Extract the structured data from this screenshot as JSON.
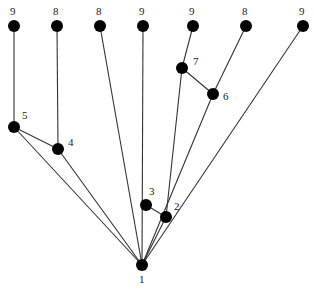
{
  "diagram": {
    "type": "tree",
    "colors": {
      "node": "#000000",
      "edge": "#333333",
      "label": "#222222",
      "background": "#ffffff"
    },
    "nodes": [
      {
        "id": "t1",
        "label": "9",
        "x": 14,
        "y": 26,
        "lx": 10,
        "ly": 15
      },
      {
        "id": "t2",
        "label": "8",
        "x": 57,
        "y": 26,
        "lx": 53,
        "ly": 15
      },
      {
        "id": "t3",
        "label": "8",
        "x": 100,
        "y": 26,
        "lx": 96,
        "ly": 15
      },
      {
        "id": "t4",
        "label": "9",
        "x": 143,
        "y": 26,
        "lx": 139,
        "ly": 15
      },
      {
        "id": "t5",
        "label": "9",
        "x": 193,
        "y": 26,
        "lx": 189,
        "ly": 15
      },
      {
        "id": "t6",
        "label": "8",
        "x": 246,
        "y": 26,
        "lx": 242,
        "ly": 15
      },
      {
        "id": "t7",
        "label": "9",
        "x": 303,
        "y": 26,
        "lx": 299,
        "ly": 15
      },
      {
        "id": "n5",
        "label": "5",
        "x": 14,
        "y": 127,
        "lx": 22,
        "ly": 119
      },
      {
        "id": "n4",
        "label": "4",
        "x": 58,
        "y": 149,
        "lx": 68,
        "ly": 146
      },
      {
        "id": "n7",
        "label": "7",
        "x": 182,
        "y": 68,
        "lx": 193,
        "ly": 65
      },
      {
        "id": "n6",
        "label": "6",
        "x": 213,
        "y": 94,
        "lx": 223,
        "ly": 100
      },
      {
        "id": "n3",
        "label": "3",
        "x": 146,
        "y": 205,
        "lx": 149,
        "ly": 195
      },
      {
        "id": "n2",
        "label": "2",
        "x": 166,
        "y": 217,
        "lx": 174,
        "ly": 210
      },
      {
        "id": "n1",
        "label": "1",
        "x": 142,
        "y": 265,
        "lx": 139,
        "ly": 283
      }
    ],
    "edges": [
      {
        "from": "t1",
        "to": "n5"
      },
      {
        "from": "n5",
        "to": "n4"
      },
      {
        "from": "n5",
        "to": "n1"
      },
      {
        "from": "t2",
        "to": "n4"
      },
      {
        "from": "n4",
        "to": "n1"
      },
      {
        "from": "t3",
        "to": "n1"
      },
      {
        "from": "t4",
        "to": "n1"
      },
      {
        "from": "n3",
        "to": "n2"
      },
      {
        "from": "t5",
        "to": "n7"
      },
      {
        "from": "n7",
        "to": "n6"
      },
      {
        "from": "n7",
        "to": "n2"
      },
      {
        "from": "t6",
        "to": "n6"
      },
      {
        "from": "n6",
        "to": "n1"
      },
      {
        "from": "n2",
        "to": "n1"
      },
      {
        "from": "t7",
        "to": "n1"
      }
    ]
  }
}
